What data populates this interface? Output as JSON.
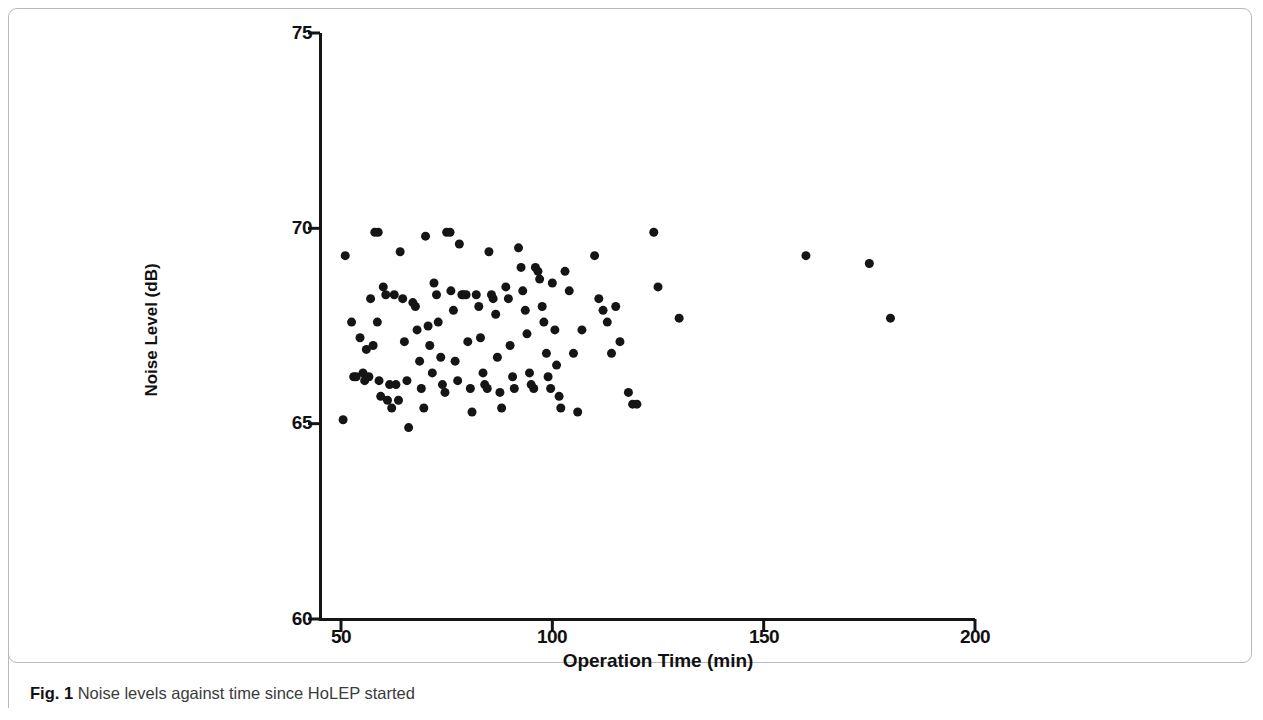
{
  "figure": {
    "caption_prefix": "Fig. 1",
    "caption_text": "Noise levels against time since HoLEP started"
  },
  "chart_data": {
    "type": "scatter",
    "title": "",
    "xlabel": "Operation Time (min)",
    "ylabel": "Noise Level (dB)",
    "xlim": [
      50,
      200
    ],
    "ylim": [
      60,
      75
    ],
    "xticks": [
      50,
      100,
      150,
      200
    ],
    "yticks": [
      60,
      65,
      70,
      75
    ],
    "grid": false,
    "legend": null,
    "marker": {
      "shape": "circle",
      "color": "#151515",
      "size_px": 9
    },
    "points": [
      [
        50.5,
        65.1
      ],
      [
        51.0,
        69.3
      ],
      [
        52.5,
        67.6
      ],
      [
        53.0,
        66.2
      ],
      [
        53.6,
        66.2
      ],
      [
        54.5,
        67.2
      ],
      [
        55.2,
        66.3
      ],
      [
        55.6,
        66.1
      ],
      [
        56.0,
        66.9
      ],
      [
        56.6,
        66.2
      ],
      [
        57.0,
        68.2
      ],
      [
        57.6,
        67.0
      ],
      [
        58.0,
        69.9
      ],
      [
        58.8,
        69.9
      ],
      [
        58.6,
        67.6
      ],
      [
        59.0,
        66.1
      ],
      [
        59.4,
        65.7
      ],
      [
        60.0,
        68.5
      ],
      [
        60.6,
        68.3
      ],
      [
        61.0,
        65.6
      ],
      [
        61.5,
        66.0
      ],
      [
        62.0,
        65.4
      ],
      [
        62.6,
        68.3
      ],
      [
        63.0,
        66.0
      ],
      [
        63.6,
        65.6
      ],
      [
        64.0,
        69.4
      ],
      [
        64.6,
        68.2
      ],
      [
        65.0,
        67.1
      ],
      [
        65.6,
        66.1
      ],
      [
        66.0,
        64.9
      ],
      [
        67.0,
        68.1
      ],
      [
        67.6,
        68.0
      ],
      [
        68.0,
        67.4
      ],
      [
        68.6,
        66.6
      ],
      [
        69.0,
        65.9
      ],
      [
        69.6,
        65.4
      ],
      [
        70.0,
        69.8
      ],
      [
        70.6,
        67.5
      ],
      [
        71.0,
        67.0
      ],
      [
        71.6,
        66.3
      ],
      [
        72.0,
        68.6
      ],
      [
        72.6,
        68.3
      ],
      [
        73.0,
        67.6
      ],
      [
        73.6,
        66.7
      ],
      [
        74.0,
        66.0
      ],
      [
        74.6,
        65.8
      ],
      [
        75.0,
        69.9
      ],
      [
        75.8,
        69.9
      ],
      [
        76.0,
        68.4
      ],
      [
        76.6,
        67.9
      ],
      [
        77.0,
        66.6
      ],
      [
        77.6,
        66.1
      ],
      [
        78.0,
        69.6
      ],
      [
        78.6,
        68.3
      ],
      [
        79.0,
        68.3
      ],
      [
        79.6,
        68.3
      ],
      [
        80.0,
        67.1
      ],
      [
        80.6,
        65.9
      ],
      [
        81.0,
        65.3
      ],
      [
        82.0,
        68.3
      ],
      [
        82.6,
        68.0
      ],
      [
        83.0,
        67.2
      ],
      [
        83.6,
        66.3
      ],
      [
        84.0,
        66.0
      ],
      [
        84.6,
        65.9
      ],
      [
        85.0,
        69.4
      ],
      [
        85.6,
        68.3
      ],
      [
        86.0,
        68.2
      ],
      [
        86.6,
        67.8
      ],
      [
        87.0,
        66.7
      ],
      [
        87.6,
        65.8
      ],
      [
        88.0,
        65.4
      ],
      [
        89.0,
        68.5
      ],
      [
        89.6,
        68.2
      ],
      [
        90.0,
        67.0
      ],
      [
        90.6,
        66.2
      ],
      [
        91.0,
        65.9
      ],
      [
        92.0,
        69.5
      ],
      [
        92.6,
        69.0
      ],
      [
        93.0,
        68.4
      ],
      [
        93.6,
        67.9
      ],
      [
        94.0,
        67.3
      ],
      [
        94.6,
        66.3
      ],
      [
        95.0,
        66.0
      ],
      [
        95.6,
        65.9
      ],
      [
        96.0,
        69.0
      ],
      [
        96.6,
        68.9
      ],
      [
        97.0,
        68.7
      ],
      [
        97.6,
        68.0
      ],
      [
        98.0,
        67.6
      ],
      [
        98.6,
        66.8
      ],
      [
        99.0,
        66.2
      ],
      [
        99.6,
        65.9
      ],
      [
        100.0,
        68.6
      ],
      [
        100.6,
        67.4
      ],
      [
        101.0,
        66.5
      ],
      [
        101.6,
        65.7
      ],
      [
        102.0,
        65.4
      ],
      [
        103.0,
        68.9
      ],
      [
        104.0,
        68.4
      ],
      [
        105.0,
        66.8
      ],
      [
        106.0,
        65.3
      ],
      [
        107.0,
        67.4
      ],
      [
        110.0,
        69.3
      ],
      [
        111.0,
        68.2
      ],
      [
        112.0,
        67.9
      ],
      [
        113.0,
        67.6
      ],
      [
        114.0,
        66.8
      ],
      [
        115.0,
        68.0
      ],
      [
        116.0,
        67.1
      ],
      [
        118.0,
        65.8
      ],
      [
        119.0,
        65.5
      ],
      [
        120.0,
        65.5
      ],
      [
        124.0,
        69.9
      ],
      [
        125.0,
        68.5
      ],
      [
        130.0,
        67.7
      ],
      [
        160.0,
        69.3
      ],
      [
        175.0,
        69.1
      ],
      [
        180.0,
        67.7
      ]
    ]
  },
  "axes": {
    "y_tick_labels": [
      "75",
      "70",
      "65",
      "60"
    ],
    "x_tick_labels": [
      "50",
      "100",
      "150",
      "200"
    ]
  }
}
